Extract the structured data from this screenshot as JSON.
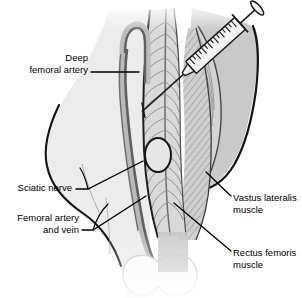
{
  "figure": {
    "view": "Anterior view of right thigh with syringe inserted into vastus lateralis"
  },
  "labels": [
    {
      "id": "deep-femoral-artery",
      "lines": [
        "Deep",
        "femoral artery"
      ],
      "align": "right",
      "text_x": 88,
      "text_y": 62,
      "line_height": 12,
      "leader": "M 91,72 L 139,72"
    },
    {
      "id": "sciatic-nerve",
      "lines": [
        "Sciatic nerve"
      ],
      "align": "right",
      "text_x": 72,
      "text_y": 192,
      "line_height": 12,
      "leader": "M 76,189 L 88,189 L 143,161"
    },
    {
      "id": "femoral-artery-and-vein",
      "lines": [
        "Femoral artery",
        "and vein"
      ],
      "align": "right",
      "text_x": 79,
      "text_y": 222,
      "line_height": 12,
      "leader": "M 82,230 L 93,230 L 146,196"
    },
    {
      "id": "vastus-lateralis-muscle",
      "lines": [
        "Vastus lateralis",
        "muscle"
      ],
      "align": "left",
      "text_x": 233,
      "text_y": 202,
      "line_height": 12,
      "leader": "M 231,196 L 206,172"
    },
    {
      "id": "rectus-femoris-muscle",
      "lines": [
        "Rectus femoris",
        "muscle"
      ],
      "align": "left",
      "text_x": 233,
      "text_y": 257,
      "line_height": 12,
      "leader": "M 231,251 L 174,203"
    }
  ],
  "anatomy": {
    "syringe": {
      "name": "syringe",
      "angle_degrees": 48,
      "graduation_count": 17
    },
    "structures": [
      "rectus-femoris",
      "vastus-lateralis",
      "vastus-medialis",
      "femoral-vessels",
      "patella"
    ]
  },
  "colors": {
    "outline": "#111111",
    "thigh_left_fill": "#ebebeb",
    "thigh_right_fill": "#c9c9c9",
    "muscle_fill": "#d8d8d8",
    "muscle_mid": "#cccccc",
    "striation": "#8e8e8e",
    "vessel": "#6f6f6f",
    "vessel_light": "#bcbcbc",
    "syringe_body": "#f2f2f2",
    "patella_fill": "#fbfbfb",
    "text": "#000000"
  }
}
